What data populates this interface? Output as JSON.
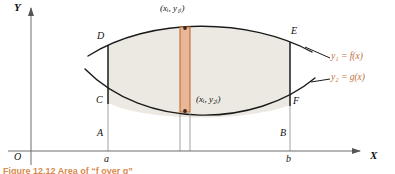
{
  "figure": {
    "type": "area-between-two-curves",
    "axes": {
      "x_label": "X",
      "y_label": "Y",
      "origin_label": "O",
      "x_tick_labels": [
        "a",
        "b"
      ],
      "arrowheads": [
        "x-positive",
        "y-positive"
      ]
    },
    "curve_labels": {
      "upper": "y₁ = f(x)",
      "lower": "y₂ = g(x)"
    },
    "point_labels": {
      "upper_strip_point": "(xᵢ, y₁ᵢ)",
      "lower_strip_point": "(xᵢ, y₂ᵢ)"
    },
    "vertex_labels": {
      "upper_left": "D",
      "upper_right": "E",
      "lower_left": "C",
      "lower_right": "F",
      "base_left": "A",
      "base_right": "B"
    },
    "caption": "Figure 12.12   Area of “f over g”",
    "colors": {
      "region_fill": "#ebe9e1",
      "strip_fill": "#e8b896",
      "strip_edge": "#c06a3a",
      "curve_stroke": "#1a1a1a",
      "axis_stroke": "#6d6d6d",
      "label_accent": "#c0703c",
      "caption_accent": "#d98a4e"
    }
  }
}
